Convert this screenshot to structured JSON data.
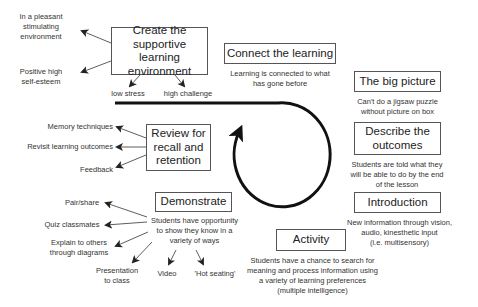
{
  "diagram": {
    "center_cycle": {
      "shape": "looped-arrow",
      "color": "#111111"
    },
    "stages": [
      {
        "id": "create",
        "title": "Create the supportive learning environment",
        "title_lines": [
          "Create the",
          "supportive learning",
          "environment"
        ],
        "outcomes": [
          "In a pleasant stimulating environment",
          "Positive high self-esteem",
          "low stress",
          "high challenge"
        ],
        "outcome_lines": {
          "pleasant": [
            "In a pleasant",
            "stimulating",
            "environment"
          ],
          "esteem": [
            "Positive high",
            "self-esteem"
          ]
        }
      },
      {
        "id": "connect",
        "title": "Connect the learning",
        "description": "Learning is connected to what has gone before",
        "description_lines": [
          "Learning is connected to what",
          "has gone before"
        ]
      },
      {
        "id": "bigpicture",
        "title": "The big picture",
        "description": "Can't do a jigsaw puzzle without picture on box",
        "description_lines": [
          "Can't do a jigsaw puzzle",
          "without picture on box"
        ]
      },
      {
        "id": "describe",
        "title": "Describe the outcomes",
        "title_lines": [
          "Describe the",
          "outcomes"
        ],
        "description": "Students are told what they will be able to do by the end of the lesson",
        "description_lines": [
          "Students are told what they",
          "will be able to do by the end",
          "of the lesson"
        ]
      },
      {
        "id": "introduction",
        "title": "Introduction",
        "description": "New information through vision, audio, kinesthetic input (i.e. multisensory)",
        "description_lines": [
          "New information through vision,",
          "audio, kinesthetic input",
          "(i.e. multisensory)"
        ]
      },
      {
        "id": "activity",
        "title": "Activity",
        "description": "Students have a chance to search for meaning and process information using a variety of learning preferences (multiple intelligence)",
        "description_lines": [
          "Students have a chance to search for",
          "meaning and process information using",
          "a variety of learning preferences",
          "(multiple intelligence)"
        ]
      },
      {
        "id": "demonstrate",
        "title": "Demonstrate",
        "description": "Students have opportunity to show they know in a variety of ways",
        "description_lines": [
          "Students have opportunity",
          "to show they know in a",
          "variety of ways"
        ],
        "outcomes": [
          "Pair/share",
          "Quiz classmates",
          "Explain to others through diagrams",
          "Presentation to class",
          "Video",
          "'Hot seating'"
        ],
        "outcome_lines": {
          "explain": [
            "Explain to others",
            "through diagrams"
          ],
          "presentation": [
            "Presentation",
            "to class"
          ]
        }
      },
      {
        "id": "review",
        "title": "Review for recall and retention",
        "title_lines": [
          "Review for",
          "recall and",
          "retention"
        ],
        "outcomes": [
          "Memory techniques",
          "Revisit learning outcomes",
          "Feedback"
        ]
      }
    ]
  }
}
